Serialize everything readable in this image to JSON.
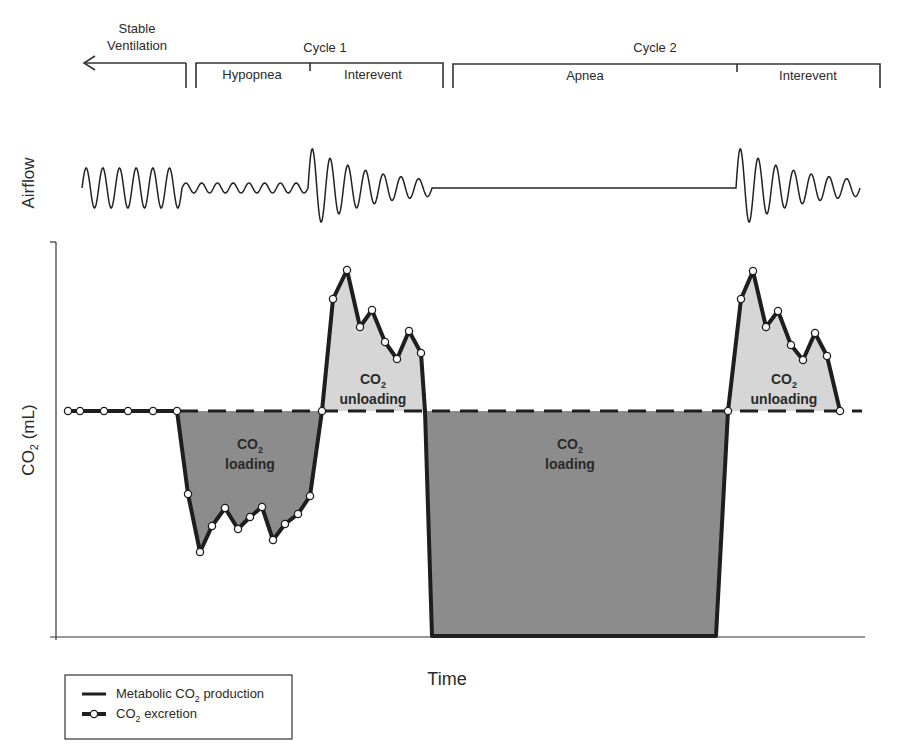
{
  "phases": {
    "stable": {
      "line1": "Stable",
      "line2": "Ventilation"
    },
    "cycle1": {
      "label": "Cycle 1",
      "sub": [
        "Hypopnea",
        "Interevent"
      ]
    },
    "cycle2": {
      "label": "Cycle 2",
      "sub": [
        "Apnea",
        "Interevent"
      ]
    }
  },
  "axes": {
    "airflow_label": "Airflow",
    "co2_label": "CO",
    "co2_sub": "2",
    "co2_unit": " (mL)",
    "x_label": "Time"
  },
  "regions": {
    "load1": {
      "co": "CO",
      "sub": "2",
      "text": "loading"
    },
    "unload1": {
      "co": "CO",
      "sub": "2",
      "text": "unloading"
    },
    "load2": {
      "co": "CO",
      "sub": "2",
      "text": "loading"
    },
    "unload2": {
      "co": "CO",
      "sub": "2",
      "text": "unloading"
    }
  },
  "legend": {
    "item1_pre": "Metabolic CO",
    "item1_sub": "2",
    "item1_post": " production",
    "item2_pre": "CO",
    "item2_sub": "2",
    "item2_post": " excretion"
  },
  "colors": {
    "loading_fill": "#8c8c8c",
    "unloading_fill": "#d6d6d6",
    "line": "#1e1e1e"
  },
  "chart_data": {
    "type": "line",
    "title": "",
    "xlabel": "Time",
    "ylabel": "CO2 (mL)",
    "series": [
      {
        "name": "Metabolic CO2 production",
        "style": "dashed horizontal baseline",
        "value": "constant"
      },
      {
        "name": "CO2 excretion",
        "style": "solid line with open circle markers"
      }
    ],
    "phases": [
      "Stable Ventilation",
      "Cycle 1: Hypopnea",
      "Cycle 1: Interevent",
      "Cycle 2: Apnea",
      "Cycle 2: Interevent"
    ],
    "annotations": [
      "CO2 loading",
      "CO2 unloading",
      "CO2 loading",
      "CO2 unloading"
    ]
  }
}
